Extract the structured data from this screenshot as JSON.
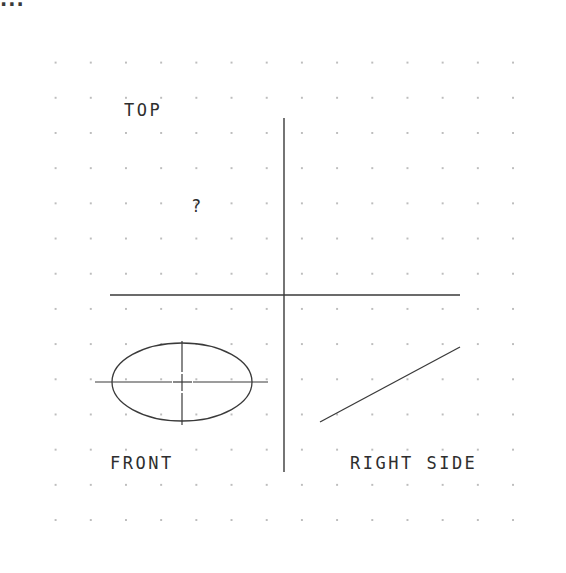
{
  "page": {
    "width": 566,
    "height": 573,
    "background_color": "#ffffff",
    "ink_color": "#333333",
    "grid_dot_color": "#b9b9b9",
    "top_fragment_text": "..."
  },
  "labels": {
    "top_view": "TOP",
    "front_view": "FRONT",
    "right_side_view": "RIGHT SIDE",
    "unknown_marker": "?"
  },
  "grid": {
    "origin_x": 38,
    "origin_y": 45,
    "spacing": 35.2,
    "columns": 15,
    "rows": 15
  },
  "geometry": {
    "projection_axes": {
      "vertical_line": {
        "x": 284,
        "y1": 118,
        "y2": 472
      },
      "horizontal_line": {
        "y": 295,
        "x1": 110,
        "x2": 460
      }
    },
    "front_view_ellipse": {
      "center_x": 182,
      "center_y": 382,
      "radius_x": 70,
      "radius_y": 39
    },
    "front_view_centerlines": {
      "horizontal": {
        "y": 382,
        "x1": 95,
        "x2": 268
      },
      "vertical": {
        "x": 182,
        "y1": 341,
        "y2": 425
      }
    },
    "right_side_diagonal": {
      "x1": 320,
      "y1": 422,
      "x2": 460,
      "y2": 347
    }
  }
}
